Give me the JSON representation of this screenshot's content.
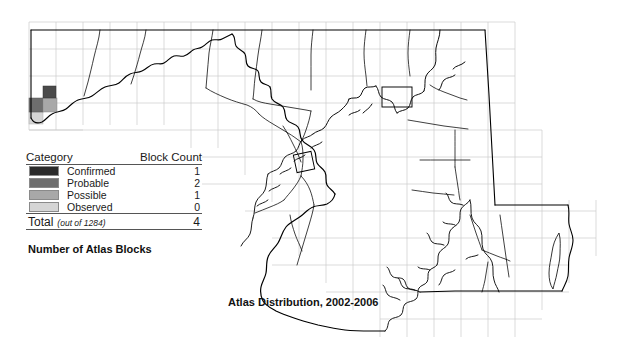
{
  "map": {
    "title": "Atlas Distribution, 2002-2006",
    "legend_caption": "Number of Atlas Blocks",
    "background_color": "#ffffff",
    "outline_color": "#000000",
    "grid_color": "#cccccc",
    "legend": {
      "header": {
        "category": "Category",
        "block_count": "Block Count"
      },
      "rows": [
        {
          "label": "Confirmed",
          "count": "1",
          "color": "#2b2b2b"
        },
        {
          "label": "Probable",
          "count": "2",
          "color": "#6e6e6e"
        },
        {
          "label": "Possible",
          "count": "1",
          "color": "#a8a8a8"
        },
        {
          "label": "Observed",
          "count": "0",
          "color": "#d5d5d5"
        }
      ],
      "total": {
        "label": "Total",
        "note": "(out of 1284)",
        "count": "4"
      }
    },
    "shaded_blocks": [
      {
        "x": 30,
        "y": 100,
        "w": 13,
        "h": 13,
        "color": "#6e6e6e"
      },
      {
        "x": 43,
        "y": 100,
        "w": 13,
        "h": 13,
        "color": "#a8a8a8"
      },
      {
        "x": 43,
        "y": 88,
        "w": 13,
        "h": 12,
        "color": "#2b2b2b"
      },
      {
        "x": 30,
        "y": 113,
        "w": 13,
        "h": 10,
        "color": "#d5d5d5"
      }
    ]
  }
}
